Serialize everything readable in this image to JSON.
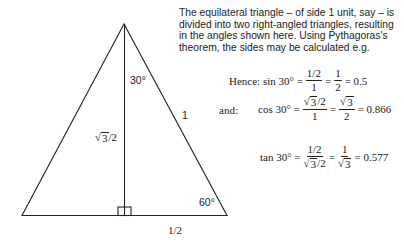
{
  "description": "The equilateral triangle – of side 1 unit, say – is divided into two right-angled triangles, resulting in the angles shown here. Using Pythagoras's theorem, the sides may be calculated e.g.",
  "triangle": {
    "apex_angle_label": "30°",
    "base_angle_label": "60°",
    "hypotenuse_label": "1",
    "height_label": {
      "radical": "√",
      "radicand": "3",
      "rest": "/2"
    },
    "half_base_label": "1/2",
    "stroke_color": "#222222"
  },
  "equations": {
    "sin": {
      "prefix": "Hence: sin 30° =",
      "frac1_num": "1/2",
      "frac1_den": "1",
      "eq1": "=",
      "frac2_num": "1",
      "frac2_den": "2",
      "result": "= 0.5"
    },
    "cos": {
      "lead": "and:",
      "prefix": "cos 30° =",
      "frac1_num_radicand": "3",
      "frac1_num_rest": "/2",
      "frac1_den": "1",
      "eq1": "=",
      "frac2_num_radicand": "3",
      "frac2_den": "2",
      "result": "= 0.866"
    },
    "tan": {
      "prefix": "tan 30° =",
      "frac1_num": "1/2",
      "frac1_den_radicand": "3",
      "frac1_den_rest": "/2",
      "eq1": "=",
      "frac2_num": "1",
      "frac2_den_radicand": "3",
      "result": "= 0.577"
    },
    "radical": "√"
  }
}
